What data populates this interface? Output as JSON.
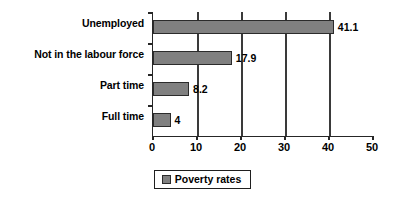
{
  "chart_data": {
    "type": "bar",
    "orientation": "horizontal",
    "title": "",
    "xlabel": "",
    "ylabel": "",
    "categories": [
      "Unemployed",
      "Not in the labour force",
      "Part time",
      "Full time"
    ],
    "values": [
      41.1,
      17.9,
      8.2,
      4
    ],
    "value_labels": [
      "41.1",
      "17.9",
      "8.2",
      "4"
    ],
    "series": [
      {
        "name": "Poverty rates",
        "values": [
          41.1,
          17.9,
          8.2,
          4
        ]
      }
    ],
    "xlim": [
      0,
      50
    ],
    "xticks": [
      0,
      10,
      20,
      30,
      40,
      50
    ],
    "xtick_labels": [
      "0",
      "10",
      "20",
      "30",
      "40",
      "50"
    ],
    "grid": "vertical",
    "legend": {
      "position": "bottom-center",
      "entries": [
        "Poverty rates"
      ]
    },
    "colors": {
      "bar_fill": "#808080",
      "bar_border": "#2b2b2b",
      "axis": "#262626",
      "grid": "#3a3a3a",
      "background": "#ffffff",
      "text": "#000000"
    }
  }
}
